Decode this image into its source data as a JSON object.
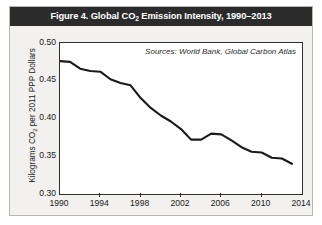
{
  "figure": {
    "title_prefix": "Figure 4. Global CO",
    "title_sub": "2",
    "title_suffix": " Emission Intensity, 1990–2013",
    "title_full": "Figure 4. Global CO2 Emission Intensity, 1990–2013",
    "source_note": "Sources: World Bank, Global Carbon Atlas",
    "y_axis_title_prefix": "Kilograms CO",
    "y_axis_title_sub": "2",
    "y_axis_title_suffix": " per 2011 PPP Dollars",
    "colors": {
      "title_bar_background": "#2b2b2b",
      "title_text": "#ffffff",
      "card_background": "#f2f1ef",
      "plot_background": "#ffffff",
      "axis": "#2f2f2f",
      "series_line": "#1a1a1a",
      "card_border": "#b9b6b0"
    }
  },
  "chart_data": {
    "type": "line",
    "title": "Figure 4. Global CO2 Emission Intensity, 1990–2013",
    "subtitle": "",
    "xlabel": "",
    "ylabel": "Kilograms CO2 per 2011 PPP Dollars",
    "annotation": "Sources: World Bank, Global Carbon Atlas",
    "grid": false,
    "legend": false,
    "legend_position": "none",
    "xlim": [
      1990,
      2014
    ],
    "ylim": [
      0.3,
      0.5
    ],
    "xticks": [
      1990,
      1994,
      1998,
      2002,
      2006,
      2010,
      2014
    ],
    "xtick_labels": [
      "1990",
      "1994",
      "1998",
      "2002",
      "2006",
      "2010",
      "2014"
    ],
    "yticks": [
      0.3,
      0.35,
      0.4,
      0.45,
      0.5
    ],
    "ytick_labels": [
      "0.30",
      "0.35",
      "0.40",
      "0.45",
      "0.50"
    ],
    "x": [
      1990,
      1991,
      1992,
      1993,
      1994,
      1995,
      1996,
      1997,
      1998,
      1999,
      2000,
      2001,
      2002,
      2003,
      2004,
      2005,
      2006,
      2007,
      2008,
      2009,
      2010,
      2011,
      2012,
      2013
    ],
    "series": [
      {
        "name": "Global CO2 emission intensity",
        "values": [
          0.476,
          0.475,
          0.466,
          0.463,
          0.462,
          0.452,
          0.447,
          0.444,
          0.427,
          0.414,
          0.404,
          0.396,
          0.386,
          0.372,
          0.372,
          0.38,
          0.379,
          0.371,
          0.362,
          0.356,
          0.355,
          0.348,
          0.347,
          0.34
        ]
      }
    ]
  }
}
